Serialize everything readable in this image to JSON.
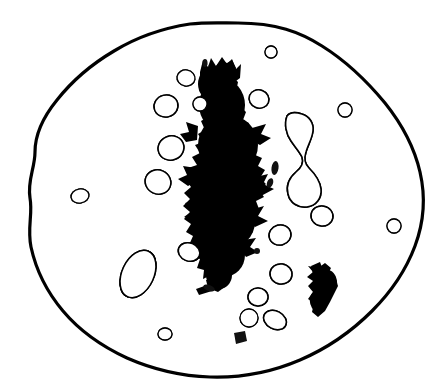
{
  "figure": {
    "title": "Histological line drawing of a cell with large irregular dark mass and surrounding nucleated cells",
    "caption": "",
    "background_color": "#ffffff",
    "ink_color": "#000000",
    "width": 437,
    "height": 391
  },
  "chart_data": {
    "type": "diagram",
    "title": "",
    "subtitle": "",
    "xlabel": "",
    "ylabel": "",
    "legend": [],
    "annotations": [],
    "grid": false,
    "elements": {
      "outer_boundary": {
        "name": "cell-membrane-outline",
        "stroke_width": 3.2,
        "fill": "#ffffff",
        "stroke": "#000000",
        "bbox": [
          28,
          22,
          425,
          378
        ]
      },
      "central_mass": {
        "name": "central-dark-mass",
        "fill": "#000000",
        "bbox": [
          183,
          60,
          278,
          290
        ],
        "description": "large elongated irregular black mass oriented vertically through the centre"
      },
      "dividing_cell": {
        "name": "dividing-dumbbell-cell",
        "cx": 298,
        "cy": 150,
        "fill": "#ffffff",
        "stroke": "#000000",
        "description": "hourglass / dumbbell shaped cell with two stippled lobes joined by a narrow bridge"
      },
      "dark_irregular_body": {
        "name": "lower-right-dark-body",
        "cx": 322,
        "cy": 290,
        "fill": "#000000"
      }
    },
    "small_cells": [
      {
        "id": 1,
        "cx": 271,
        "cy": 52,
        "rx": 6,
        "ry": 6,
        "rot": 0,
        "nr": 3.0
      },
      {
        "id": 2,
        "cx": 186,
        "cy": 78,
        "rx": 9,
        "ry": 8,
        "rot": 10,
        "nr": 4.4
      },
      {
        "id": 3,
        "cx": 166,
        "cy": 106,
        "rx": 12,
        "ry": 11,
        "rot": -15,
        "nr": 5.6
      },
      {
        "id": 4,
        "cx": 200,
        "cy": 104,
        "rx": 7,
        "ry": 7,
        "rot": 0,
        "nr": 3.6
      },
      {
        "id": 5,
        "cx": 259,
        "cy": 99,
        "rx": 10,
        "ry": 9,
        "rot": 20,
        "nr": 4.6
      },
      {
        "id": 6,
        "cx": 345,
        "cy": 110,
        "rx": 7,
        "ry": 7,
        "rot": 0,
        "nr": 3.4
      },
      {
        "id": 7,
        "cx": 171,
        "cy": 148,
        "rx": 13,
        "ry": 12,
        "rot": -20,
        "nr": 6.4
      },
      {
        "id": 8,
        "cx": 158,
        "cy": 182,
        "rx": 13,
        "ry": 12,
        "rot": 25,
        "nr": 6.0
      },
      {
        "id": 9,
        "cx": 80,
        "cy": 196,
        "rx": 9,
        "ry": 7,
        "rot": -10,
        "nr": 3.8
      },
      {
        "id": 10,
        "cx": 322,
        "cy": 216,
        "rx": 11,
        "ry": 10,
        "rot": 10,
        "nr": 5.2
      },
      {
        "id": 11,
        "cx": 394,
        "cy": 226,
        "rx": 7,
        "ry": 7,
        "rot": 0,
        "nr": 3.4
      },
      {
        "id": 12,
        "cx": 280,
        "cy": 235,
        "rx": 11,
        "ry": 10,
        "rot": -15,
        "nr": 5.0
      },
      {
        "id": 13,
        "cx": 189,
        "cy": 252,
        "rx": 11,
        "ry": 9,
        "rot": 22,
        "nr": 4.8
      },
      {
        "id": 14,
        "cx": 281,
        "cy": 274,
        "rx": 11,
        "ry": 10,
        "rot": 8,
        "nr": 5.0
      },
      {
        "id": 15,
        "cx": 258,
        "cy": 297,
        "rx": 10,
        "ry": 9,
        "rot": 0,
        "nr": 4.6
      },
      {
        "id": 16,
        "cx": 249,
        "cy": 318,
        "rx": 9,
        "ry": 9,
        "rot": 0,
        "nr": 4.2
      },
      {
        "id": 17,
        "cx": 275,
        "cy": 320,
        "rx": 12,
        "ry": 9,
        "rot": 28,
        "nr": 5.0
      },
      {
        "id": 18,
        "cx": 165,
        "cy": 334,
        "rx": 7,
        "ry": 6,
        "rot": 0,
        "nr": 3.0
      },
      {
        "id": 19,
        "cx": 138,
        "cy": 274,
        "rx": 16,
        "ry": 25,
        "rot": 25,
        "nr": 8.5
      },
      {
        "id": 20,
        "cx": 74,
        "cy": 192,
        "rx": 0,
        "ry": 0,
        "rot": 0,
        "nr": 0
      }
    ],
    "dark_specks": [
      {
        "id": "s1",
        "cx": 275,
        "cy": 168,
        "rx": 3.5,
        "ry": 7,
        "rot": 8
      },
      {
        "id": "s2",
        "cx": 270,
        "cy": 183,
        "rx": 3.0,
        "ry": 5,
        "rot": 20
      },
      {
        "id": "s3",
        "cx": 257,
        "cy": 251,
        "rx": 3.0,
        "ry": 3,
        "rot": 0
      },
      {
        "id": "s4",
        "cx": 209,
        "cy": 288,
        "rx": 6.0,
        "ry": 3,
        "rot": 20
      },
      {
        "id": "s5",
        "cx": 240,
        "cy": 338,
        "rx": 6.0,
        "ry": 5,
        "rot": 0
      },
      {
        "id": "s6",
        "cx": 205,
        "cy": 63,
        "rx": 2.5,
        "ry": 4,
        "rot": 0
      }
    ]
  }
}
